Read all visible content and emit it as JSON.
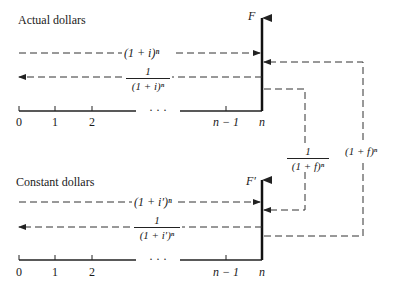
{
  "panels": [
    {
      "title": "Actual dollars",
      "axis_label": "F",
      "forward_factor": "(1 + i)ⁿ",
      "discount_factor": {
        "numerator": "1",
        "denominator": "(1 + i)ⁿ"
      },
      "ticks": [
        "0",
        "1",
        "2",
        "· · ·",
        "n − 1",
        "n"
      ]
    },
    {
      "title": "Constant dollars",
      "axis_label": "F′",
      "forward_factor": "(1 + i′)ⁿ",
      "discount_factor": {
        "numerator": "1",
        "denominator": "(1 + i′)ⁿ"
      },
      "ticks": [
        "0",
        "1",
        "2",
        "· · ·",
        "n − 1",
        "n"
      ]
    }
  ],
  "conversions": {
    "actual_to_constant": {
      "numerator": "1",
      "denominator": "(1 + f)ⁿ"
    },
    "constant_to_actual": "(1 + f)ⁿ"
  }
}
